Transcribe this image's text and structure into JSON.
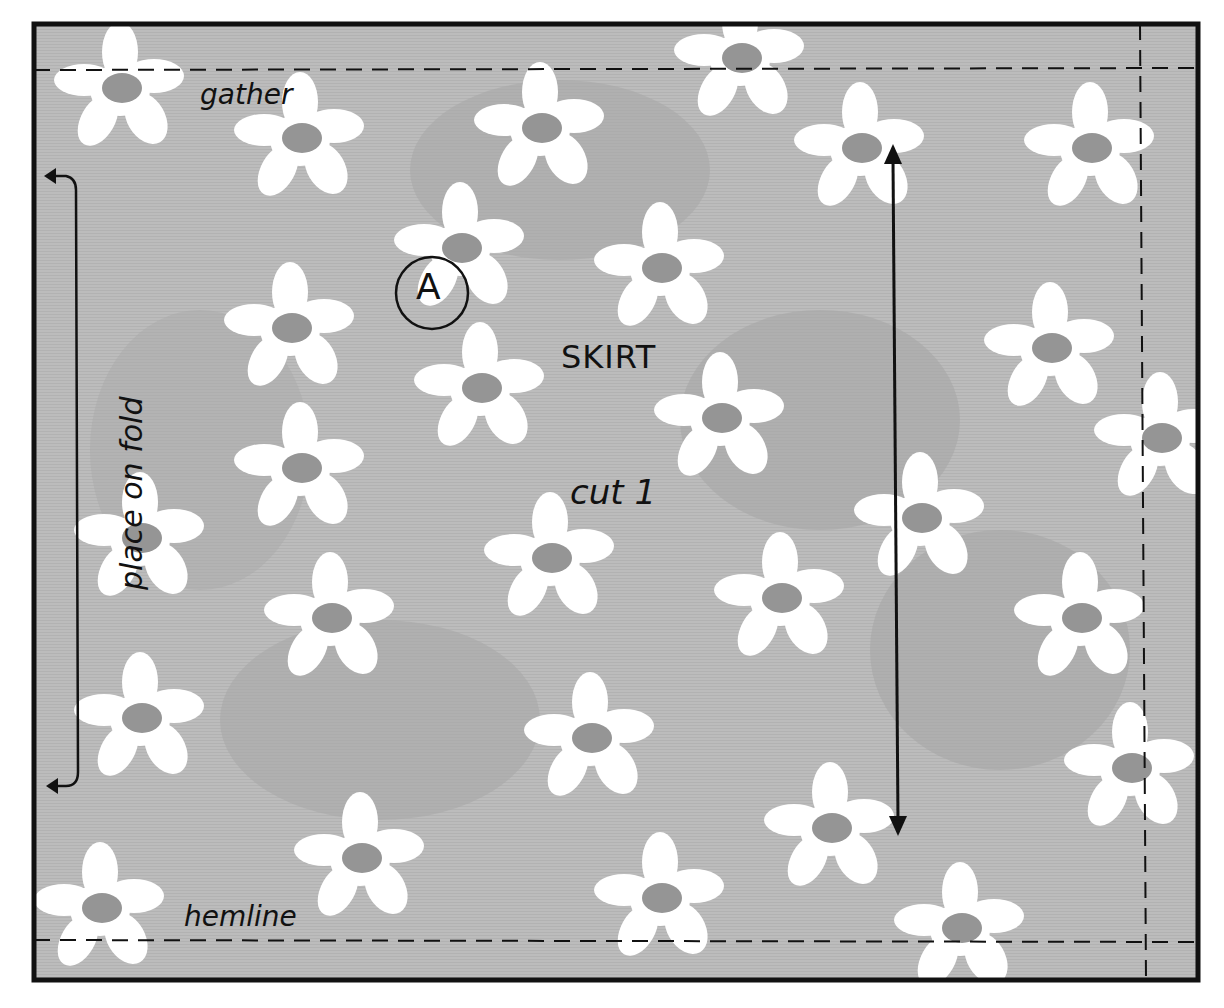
{
  "pattern_piece": {
    "id_label": "A",
    "title": "SKIRT",
    "cut_instruction": "cut 1",
    "top_edge_label": "gather",
    "bottom_edge_label": "hemline",
    "fold_label": "place on fold",
    "grainline": "straight-of-grain-arrow"
  },
  "colors": {
    "fabric_base": "#b8b8b8",
    "fabric_dark": "#9a9a9a",
    "flower_fill": "#ffffff",
    "flower_center": "#8f8f8f",
    "outline": "#111111",
    "background": "#ffffff"
  },
  "icons": {
    "grain_arrow": "double-headed-arrow-icon",
    "fold_arrow": "fold-bracket-arrow-icon",
    "piece_marker": "circled-letter-icon"
  }
}
